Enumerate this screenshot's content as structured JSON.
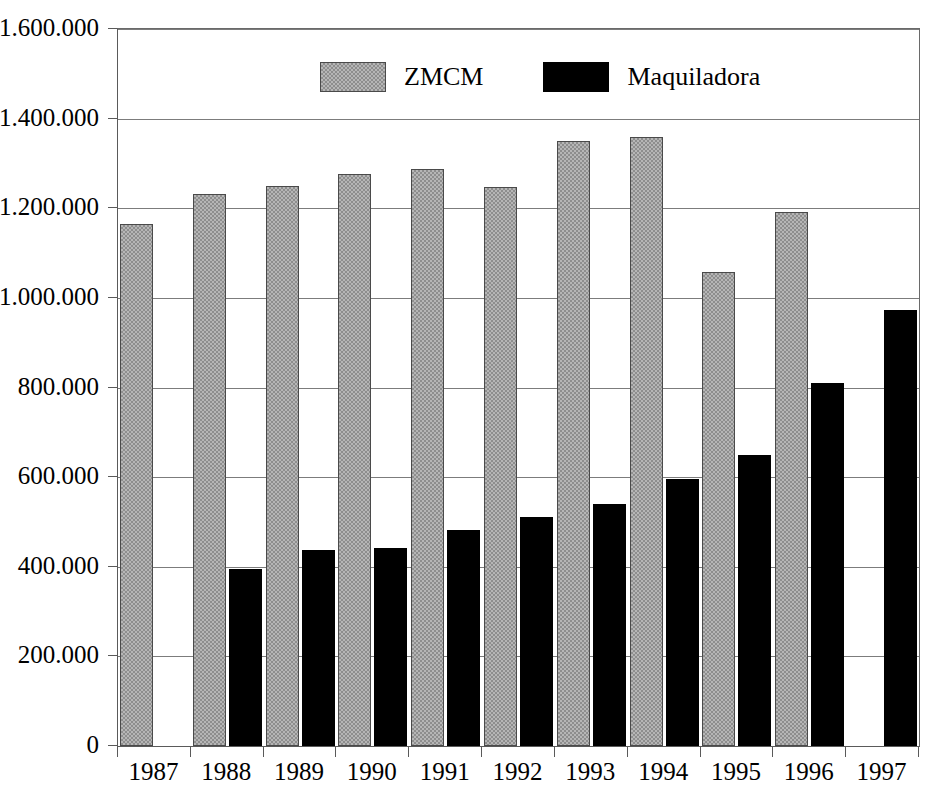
{
  "chart_data": {
    "type": "bar",
    "title": "",
    "subtitle": "",
    "xlabel": "",
    "ylabel": "",
    "categories": [
      "1987",
      "1988",
      "1989",
      "1990",
      "1991",
      "1992",
      "1993",
      "1994",
      "1995",
      "1996",
      "1997"
    ],
    "series": [
      {
        "name": "ZMCM",
        "color": "#b6b6b6",
        "pattern": "checkerboard-dither",
        "values": [
          1165000,
          1232000,
          1250000,
          1277000,
          1287000,
          1247000,
          1350000,
          1358000,
          1057000,
          1192000,
          null
        ]
      },
      {
        "name": "Maquiladora",
        "color": "#000000",
        "pattern": "solid",
        "values": [
          null,
          396000,
          438000,
          442000,
          483000,
          510000,
          539000,
          596000,
          650000,
          810000,
          973000
        ]
      }
    ],
    "ylim": [
      0,
      1600000
    ],
    "ytick_values": [
      0,
      200000,
      400000,
      600000,
      800000,
      1000000,
      1200000,
      1400000,
      1600000
    ],
    "ytick_labels": [
      "0",
      "200.000",
      "400.000",
      "600.000",
      "800.000",
      "1.000.000",
      "1.200.000",
      "1.400.000",
      "1.600.000"
    ],
    "grid": true,
    "grid_axis": "y",
    "legend_position": "top-center",
    "number_format": "european-dot-thousands"
  },
  "legend": {
    "items": [
      {
        "label": "ZMCM",
        "swatch": "gray-dither-swatch"
      },
      {
        "label": "Maquiladora",
        "swatch": "black-solid-swatch"
      }
    ]
  },
  "colors": {
    "background": "#ffffff",
    "axis": "#5a5a5a",
    "gridline": "#7c7c7c",
    "series_zmcm": "#b6b6b6",
    "series_maquiladora": "#000000",
    "text": "#000000"
  }
}
